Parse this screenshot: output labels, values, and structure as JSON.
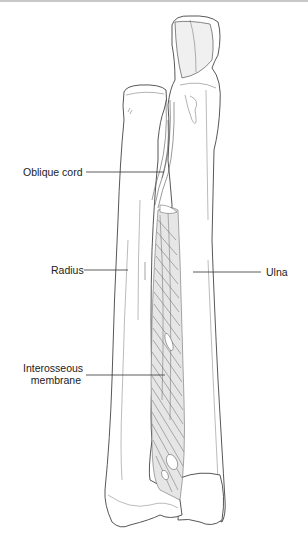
{
  "figure": {
    "labels": {
      "oblique_cord": "Oblique cord",
      "radius": "Radius",
      "ulna": "Ulna",
      "interosseous_line1": "Interosseous",
      "interosseous_line2": "membrane"
    },
    "colors": {
      "line": "#444444",
      "bone_fill": "#ffffff",
      "membrane_fill": "#e4e4e4",
      "shade": "#ebebeb",
      "leader": "#333333"
    }
  }
}
